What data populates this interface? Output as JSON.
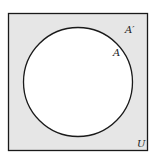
{
  "diagram": {
    "type": "venn",
    "universe": {
      "label": "U",
      "fill": "#e6e6e6"
    },
    "set": {
      "label": "A",
      "fill": "#ffffff"
    },
    "complement": {
      "label": "A′"
    },
    "stroke": "#1a1a1a"
  }
}
